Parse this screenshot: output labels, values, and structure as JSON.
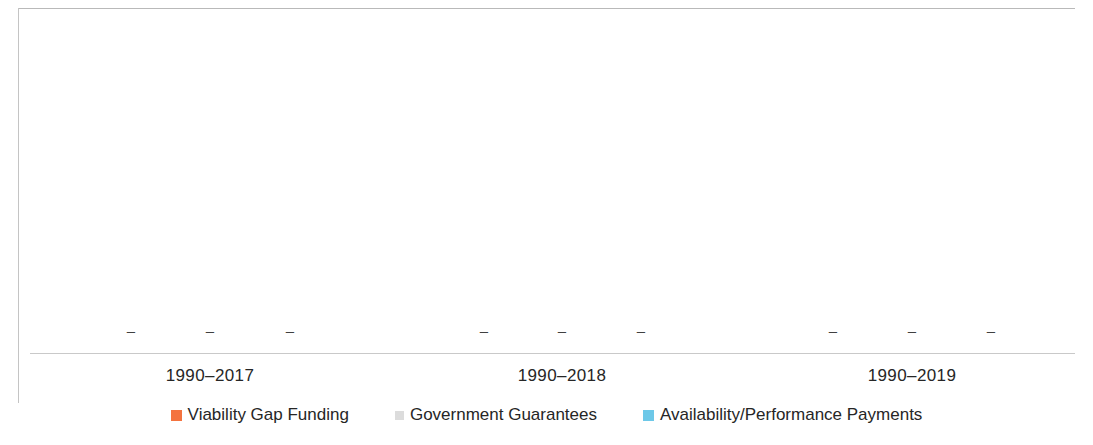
{
  "chart_data": {
    "type": "bar",
    "title": "",
    "subtitle": "",
    "xlabel": "",
    "ylabel": "",
    "grid": false,
    "legend_position": "bottom",
    "axis_line_color": "#c9c9c9",
    "frame_color": "#b9b9b9",
    "categories": [
      "1990–2017",
      "1990–2018",
      "1990–2019"
    ],
    "series": [
      {
        "name": "Viability Gap Funding",
        "color": "#F4733F",
        "values": [
          0,
          0,
          0
        ],
        "labels": [
          "–",
          "–",
          "–"
        ]
      },
      {
        "name": "Government Guarantees",
        "color": "#DCDCDC",
        "values": [
          0,
          0,
          0
        ],
        "labels": [
          "–",
          "–",
          "–"
        ]
      },
      {
        "name": "Availability/Performance Payments",
        "color": "#6DC8E8",
        "values": [
          0,
          0,
          0
        ],
        "labels": [
          "–",
          "–",
          "–"
        ]
      }
    ],
    "data_label_text": "–",
    "ylim": [
      0,
      0
    ],
    "note": "All plotted values are zero; each bar is rendered only as a dash data label above the category axis."
  },
  "axis": {
    "categories": [
      {
        "label": "1990–2017",
        "x": 210
      },
      {
        "label": "1990–2018",
        "x": 562
      },
      {
        "label": "1990–2019",
        "x": 912
      }
    ]
  },
  "data_labels": [
    {
      "text": "–",
      "x": 131,
      "series": "Viability Gap Funding",
      "category": "1990–2017"
    },
    {
      "text": "–",
      "x": 210,
      "series": "Government Guarantees",
      "category": "1990–2017"
    },
    {
      "text": "–",
      "x": 290,
      "series": "Availability/Performance Payments",
      "category": "1990–2017"
    },
    {
      "text": "–",
      "x": 484,
      "series": "Viability Gap Funding",
      "category": "1990–2018"
    },
    {
      "text": "–",
      "x": 562,
      "series": "Government Guarantees",
      "category": "1990–2018"
    },
    {
      "text": "–",
      "x": 641,
      "series": "Availability/Performance Payments",
      "category": "1990–2018"
    },
    {
      "text": "–",
      "x": 833,
      "series": "Viability Gap Funding",
      "category": "1990–2019"
    },
    {
      "text": "–",
      "x": 912,
      "series": "Government Guarantees",
      "category": "1990–2019"
    },
    {
      "text": "–",
      "x": 991,
      "series": "Availability/Performance Payments",
      "category": "1990–2019"
    }
  ],
  "legend": {
    "items": [
      {
        "label": "Viability Gap Funding",
        "color": "#F4733F",
        "size": "normal"
      },
      {
        "label": "Government Guarantees",
        "color": "#DCDCDC",
        "size": "small"
      },
      {
        "label": "Availability/Performance Payments",
        "color": "#6DC8E8",
        "size": "normal"
      }
    ]
  }
}
